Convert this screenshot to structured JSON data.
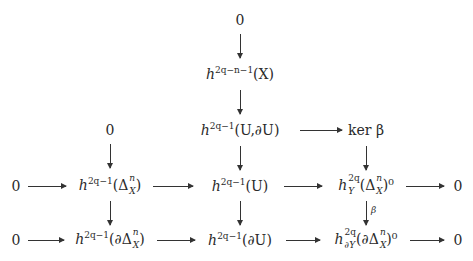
{
  "diagram": {
    "type": "commutative-diagram",
    "nodes": {
      "top_zero": "0",
      "h_X": {
        "base": "h",
        "sup": "2q−n−1",
        "arg": "(X)"
      },
      "h_U_dU": {
        "base": "h",
        "sup": "2q−1",
        "arg": "(U,∂U)"
      },
      "ker_beta": "ker β",
      "left_zero_r2": "0",
      "row3_zero_left": "0",
      "h_Delta": {
        "base": "h",
        "sup": "2q−1",
        "arg_pre": "(Δ",
        "arg_sup": "n",
        "arg_sub": "X",
        "arg_post": ")"
      },
      "h_U": {
        "base": "h",
        "sup": "2q−1",
        "arg": "(U)"
      },
      "hY_Delta0": {
        "base": "h",
        "sup": "2q",
        "sub": "Y",
        "arg_pre": "(Δ",
        "arg_sup": "n",
        "arg_sub": "X",
        "arg_post": ")⁰"
      },
      "row3_zero_right": "0",
      "row4_zero_left": "0",
      "h_dDelta": {
        "base": "h",
        "sup": "2q−1",
        "arg_pre": "(∂Δ",
        "arg_sup": "n",
        "arg_sub": "X",
        "arg_post": ")"
      },
      "h_dU": {
        "base": "h",
        "sup": "2q−1",
        "arg": "(∂U)"
      },
      "hdY_dDelta0": {
        "base": "h",
        "sup": "2q",
        "sub": "∂Y",
        "arg_pre": "(∂Δ",
        "arg_sup": "n",
        "arg_sub": "X",
        "arg_post": ")⁰"
      },
      "row4_zero_right": "0"
    },
    "arrow_labels": {
      "beta": "β"
    }
  }
}
